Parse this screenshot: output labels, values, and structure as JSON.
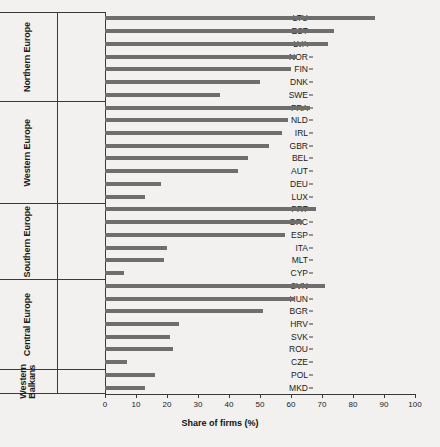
{
  "chart_data": {
    "type": "bar",
    "orientation": "horizontal",
    "title": "",
    "xlabel": "Share of firms (%)",
    "ylabel": "",
    "xlim": [
      0,
      100
    ],
    "xticks": [
      0,
      10,
      20,
      30,
      40,
      50,
      60,
      70,
      80,
      90,
      100
    ],
    "grid": false,
    "legend": null,
    "bar_color": "#6e6e6e",
    "axis_color": "#3a3a3a",
    "background_color": "#f2f1ef",
    "groups": [
      {
        "name": "Northern Europe",
        "categories": [
          "LTU",
          "EST",
          "LVA",
          "NOR",
          "FIN",
          "DNK",
          "SWE"
        ],
        "values": [
          87,
          74,
          72,
          62,
          60,
          50,
          37
        ]
      },
      {
        "name": "Western Europe",
        "categories": [
          "FRA",
          "NLD",
          "IRL",
          "GBR",
          "BEL",
          "AUT",
          "DEU",
          "LUX"
        ],
        "values": [
          66,
          59,
          57,
          53,
          46,
          43,
          18,
          13
        ]
      },
      {
        "name": "Southern Europe",
        "categories": [
          "PRT",
          "GRC",
          "ESP",
          "ITA",
          "MLT",
          "CYP"
        ],
        "values": [
          68,
          64,
          58,
          20,
          19,
          6
        ]
      },
      {
        "name": "Central Europe",
        "categories": [
          "SVN",
          "HUN",
          "BGR",
          "HRV",
          "SVK",
          "ROU",
          "CZE"
        ],
        "values": [
          71,
          61,
          51,
          24,
          21,
          22,
          7
        ]
      },
      {
        "name": "Western\nBalkans",
        "categories": [
          "POL",
          "MKD"
        ],
        "values": [
          16,
          13
        ]
      }
    ],
    "categories": [
      "LTU",
      "EST",
      "LVA",
      "NOR",
      "FIN",
      "DNK",
      "SWE",
      "FRA",
      "NLD",
      "IRL",
      "GBR",
      "BEL",
      "AUT",
      "DEU",
      "LUX",
      "PRT",
      "GRC",
      "ESP",
      "ITA",
      "MLT",
      "CYP",
      "SVN",
      "HUN",
      "BGR",
      "HRV",
      "SVK",
      "ROU",
      "CZE",
      "POL",
      "MKD"
    ],
    "values": [
      87,
      74,
      72,
      62,
      60,
      50,
      37,
      66,
      59,
      57,
      53,
      46,
      43,
      18,
      13,
      68,
      64,
      58,
      20,
      19,
      6,
      71,
      61,
      51,
      24,
      21,
      22,
      7,
      16,
      13
    ]
  }
}
